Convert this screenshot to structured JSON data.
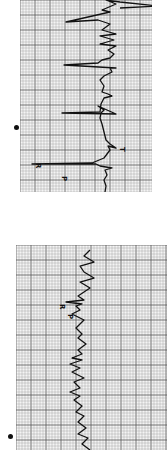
{
  "figure": {
    "strips": [
      {
        "id": "strip-a",
        "box": {
          "x": 20,
          "y": 0,
          "w": 132,
          "h": 192
        },
        "wave_labels": [
          {
            "text": "R",
            "x": 36,
            "y": 163
          },
          {
            "text": "P",
            "x": 62,
            "y": 176
          },
          {
            "text": "T",
            "x": 120,
            "y": 147
          }
        ],
        "trace": "105,192 106,186 104,180 107,175 105,170 112,168 100,166 96,164 94,164 32,164 92,163 104,158 110,150 108,146 116,148 110,144 106,140 104,132 102,124 100,118 101,113 104,110 98,106 116,114 62,113 100,112 101,104 104,98 112,96 108,94 102,92 104,86 100,80 104,76 112,72 110,68 116,68 64,65 98,63 102,60 110,58 114,54 108,50 116,46 100,44 114,40 100,36 116,34 102,30 110,24 98,20 66,22 110,12 102,10 116,4 106,0 120,2 158,6 120,8",
        "dot": {
          "x": 16,
          "y": 127
        }
      },
      {
        "id": "strip-b",
        "box": {
          "x": 16,
          "y": 245,
          "w": 151,
          "h": 205
        },
        "wave_labels": [
          {
            "text": "R",
            "x": 60,
            "y": 304
          },
          {
            "text": "P",
            "x": 68,
            "y": 314
          }
        ],
        "trace": "90,250 84,256 94,262 80,266 84,272 94,278 80,282 90,288 78,296 84,300 66,302 82,304 76,306 80,310 72,314 84,320 76,328 82,334 78,338 86,344 78,350 82,354 72,358 82,360 70,364 80,368 72,372 84,378 74,382 80,388 70,392 80,396 74,400 82,406 76,412 84,416 78,422 86,428 78,434 88,438 82,444 90,450",
        "dot": {
          "x": 10,
          "y": 436
        }
      }
    ],
    "grid": {
      "minor_px": 3,
      "major_every": 5,
      "minor_color": "#9a9a9a",
      "major_color": "#555555",
      "bg": "#f4f4f4",
      "trace_color": "#111111"
    }
  }
}
